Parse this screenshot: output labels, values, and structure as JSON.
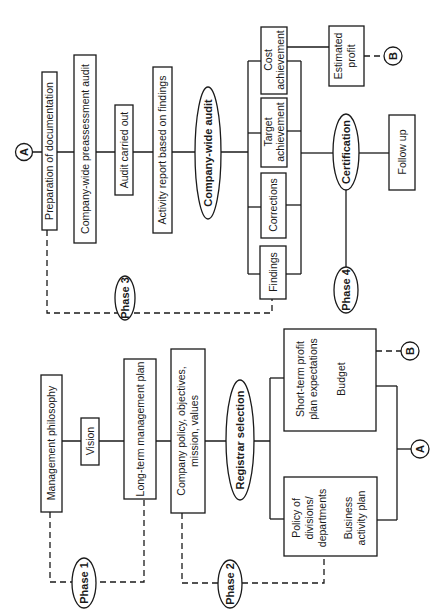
{
  "diagram": {
    "orientation": "rotated-90-ccw",
    "connectors": {
      "a": "A",
      "b": "B"
    },
    "phase1": {
      "label": "Phase 1",
      "management_philosophy": "Management philosophy",
      "vision": "Vision",
      "long_term_plan": "Long-term management plan"
    },
    "phase2": {
      "label": "Phase 2",
      "company_policy_line1": "Company policy, objectives,",
      "company_policy_line2": "mission, values",
      "registrar_selection": "Registrar selection",
      "policy_divisions_line1": "Policy of",
      "policy_divisions_line2": "divisions/",
      "policy_divisions_line3": "departments",
      "business_plan_line1": "Business",
      "business_plan_line2": "activity plan",
      "short_term_line1": "Short-term profit",
      "short_term_line2": "plan expectations",
      "budget": "Budget"
    },
    "phase3": {
      "label": "Phase 3",
      "preparation": "Preparation of documentation",
      "preassessment": "Company-wide preassessment audit",
      "audit_carried_out": "Audit carried out",
      "activity_report": "Activity report based on findings",
      "company_wide_audit": "Company-wide audit",
      "findings": "Findings",
      "corrections": "Corrections",
      "target_line1": "Target",
      "target_line2": "achievement",
      "cost_line1": "Cost",
      "cost_line2": "achievement",
      "estimated_line1": "Estimated",
      "estimated_line2": "profit"
    },
    "phase4": {
      "label": "Phase 4",
      "certification": "Certification",
      "follow_up": "Follow up"
    }
  }
}
